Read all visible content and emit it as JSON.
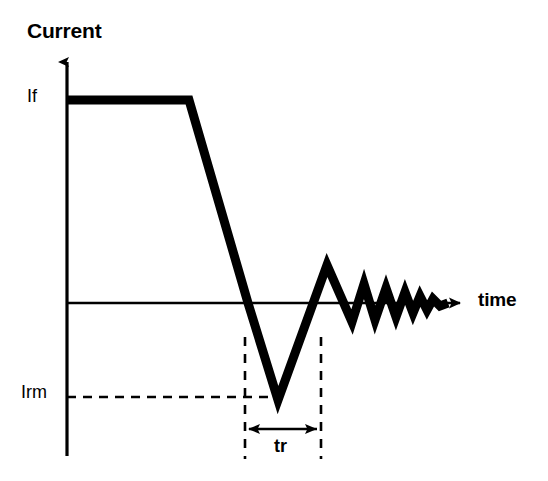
{
  "figure": {
    "kind": "diagram",
    "background_color": "#ffffff",
    "ink_color": "#000000",
    "width": 548,
    "height": 481
  },
  "labels": {
    "y_axis_title": "Current",
    "x_axis_title": "time",
    "forward_current": "If",
    "reverse_recovery_peak": "Irm",
    "recovery_time": "tr"
  },
  "axes": {
    "y_axis": {
      "name": "current-axis",
      "x": 67,
      "top_y": 55,
      "bottom_y": 456,
      "arrow": "up",
      "stroke_width": 3
    },
    "x_axis": {
      "name": "time-axis",
      "y": 303,
      "left_x": 67,
      "right_x": 466,
      "arrow": "right",
      "stroke_width": 2.5
    }
  },
  "chart_data": {
    "type": "line",
    "title": "",
    "xlabel": "time",
    "ylabel": "Current",
    "grid": false,
    "legend": null,
    "annotations": [
      {
        "text": "If",
        "kind": "level-label",
        "at_y_px": 100
      },
      {
        "text": "Irm",
        "kind": "level-label",
        "at_y_px": 397
      },
      {
        "text": "tr",
        "kind": "interval-label",
        "from_x_px": 245,
        "to_x_px": 321
      }
    ],
    "series": [
      {
        "name": "diode-current",
        "stroke_width": 9,
        "points": [
          [
            67,
            100
          ],
          [
            189,
            100
          ],
          [
            248,
            303
          ],
          [
            278,
            400
          ],
          [
            327,
            265
          ],
          [
            352,
            322
          ],
          [
            364,
            284
          ],
          [
            375,
            320
          ],
          [
            386,
            288
          ],
          [
            396,
            317
          ],
          [
            405,
            292
          ],
          [
            413,
            313
          ],
          [
            420,
            296
          ],
          [
            427,
            310
          ],
          [
            433,
            299
          ],
          [
            440,
            306
          ],
          [
            448,
            303
          ]
        ]
      }
    ]
  },
  "guide_lines": {
    "irm_horizontal_dashed": {
      "name": "irm-level-dashed-line",
      "from": [
        67,
        397
      ],
      "to": [
        281,
        397
      ],
      "dash": "9 7",
      "stroke_width": 2.5
    },
    "tr_start_dashed": {
      "name": "tr-start-dashed-line",
      "x": 245,
      "from_y": 338,
      "to_y": 458,
      "dash": "9 8",
      "stroke_width": 2.5
    },
    "tr_end_dashed": {
      "name": "tr-end-dashed-line",
      "x": 321,
      "from_y": 338,
      "to_y": 458,
      "dash": "9 8",
      "stroke_width": 2.5
    },
    "tr_measure_arrow": {
      "name": "tr-dimension-arrow",
      "y": 429,
      "from_x": 245,
      "to_x": 321,
      "arrows": "both",
      "stroke_width": 2.5
    }
  }
}
